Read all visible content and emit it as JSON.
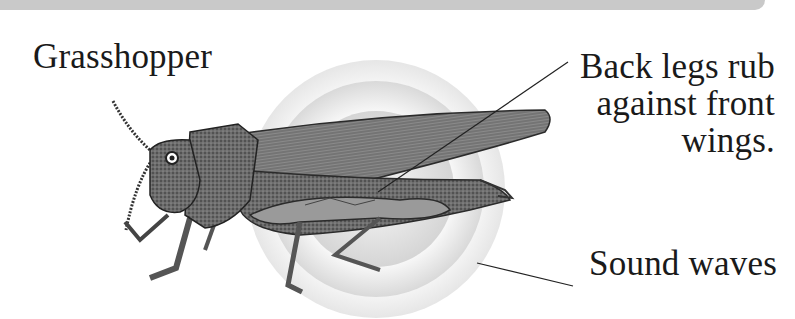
{
  "diagram": {
    "title": "Grasshopper",
    "subject_icon": "grasshopper-illustration",
    "labels": {
      "legs": "Back legs rub\nagainst front\nwings.",
      "waves": "Sound waves"
    },
    "colors": {
      "topbar": "#c9c9c9",
      "wave_outer": "#ececec",
      "wave_mid": "#dedede",
      "wave_inner": "#cfcfcf",
      "insect_dark": "#3a3a3a",
      "insect_mid": "#7a7a7a",
      "insect_light": "#b8b8b8",
      "leader_line": "#222222"
    }
  }
}
